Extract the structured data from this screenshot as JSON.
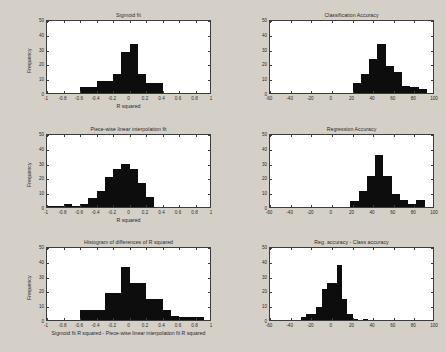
{
  "figure": {
    "background_color": "#d4d0c8",
    "plot_background_color": "#ffffff",
    "bar_color": "#0d0d0d",
    "axis_color": "#3c3c3c"
  },
  "chart_data": [
    {
      "type": "bar",
      "id": "sigmoid-fit",
      "title": "Sigmoid fit",
      "xlabel": "R squared",
      "ylabel": "Frequency",
      "xlim": [
        -1,
        1
      ],
      "ylim": [
        0,
        50
      ],
      "xticks": [
        -1,
        -0.8,
        -0.6,
        -0.4,
        -0.2,
        0,
        0.2,
        0.4,
        0.6,
        0.8,
        1
      ],
      "xticklabels": [
        "-1",
        "-0.8",
        "-0.6",
        "-0.4",
        "-0.2",
        "0",
        "0.2",
        "0.4",
        "0.6",
        "0.8",
        "1"
      ],
      "yticks": [
        0,
        10,
        20,
        30,
        40,
        50
      ],
      "yticklabels": [
        "0",
        "10",
        "20",
        "30",
        "40",
        "50"
      ],
      "grid": false,
      "bin_edges": [
        -0.6,
        -0.5,
        -0.4,
        -0.3,
        -0.2,
        -0.1,
        0.0,
        0.1,
        0.2,
        0.3,
        0.4
      ],
      "values": [
        4,
        4,
        8,
        8,
        13,
        28,
        33,
        13,
        7,
        7
      ]
    },
    {
      "type": "bar",
      "id": "classification-accuracy",
      "title": "Classification Accuracy",
      "xlabel": "",
      "ylabel": "",
      "xlim": [
        -60,
        100
      ],
      "ylim": [
        0,
        50
      ],
      "xticks": [
        -60,
        -40,
        -20,
        0,
        20,
        40,
        60,
        80,
        100
      ],
      "xticklabels": [
        "-60",
        "-40",
        "-20",
        "0",
        "20",
        "40",
        "60",
        "80",
        "100"
      ],
      "yticks": [
        0,
        10,
        20,
        30,
        40,
        50
      ],
      "yticklabels": [
        "0",
        "10",
        "20",
        "30",
        "40",
        "50"
      ],
      "grid": false,
      "bin_edges": [
        20,
        28,
        36,
        44,
        52,
        60,
        68,
        76,
        84,
        92
      ],
      "values": [
        7,
        13,
        23,
        33,
        18,
        14,
        5,
        4,
        3
      ]
    },
    {
      "type": "bar",
      "id": "piecewise-linear-fit",
      "title": "Piece-wise linear interpolation fit",
      "xlabel": "R squared",
      "ylabel": "Frequency",
      "xlim": [
        -1,
        1
      ],
      "ylim": [
        0,
        50
      ],
      "xticks": [
        -1,
        -0.8,
        -0.6,
        -0.4,
        -0.2,
        0,
        0.2,
        0.4,
        0.6,
        0.8,
        1
      ],
      "xticklabels": [
        "-1",
        "-0.8",
        "-0.6",
        "-0.4",
        "-0.2",
        "0",
        "0.2",
        "0.4",
        "0.6",
        "0.8",
        "1"
      ],
      "yticks": [
        0,
        10,
        20,
        30,
        40,
        50
      ],
      "yticklabels": [
        "0",
        "10",
        "20",
        "30",
        "40",
        "50"
      ],
      "grid": false,
      "bin_edges": [
        -1.0,
        -0.9,
        -0.8,
        -0.7,
        -0.6,
        -0.5,
        -0.4,
        -0.3,
        -0.2,
        -0.1,
        0.0,
        0.1,
        0.2,
        0.3
      ],
      "values": [
        1,
        1,
        2,
        1,
        2,
        6,
        11,
        20,
        26,
        29,
        26,
        16,
        7
      ]
    },
    {
      "type": "bar",
      "id": "regression-accuracy",
      "title": "Regression Accuracy",
      "xlabel": "",
      "ylabel": "",
      "xlim": [
        -60,
        100
      ],
      "ylim": [
        0,
        50
      ],
      "xticks": [
        -60,
        -40,
        -20,
        0,
        20,
        40,
        60,
        80,
        100
      ],
      "xticklabels": [
        "-60",
        "-40",
        "-20",
        "0",
        "20",
        "40",
        "60",
        "80",
        "100"
      ],
      "yticks": [
        0,
        10,
        20,
        30,
        40,
        50
      ],
      "yticklabels": [
        "0",
        "10",
        "20",
        "30",
        "40",
        "50"
      ],
      "grid": false,
      "bin_edges": [
        18,
        26,
        34,
        42,
        50,
        58,
        66,
        74,
        82,
        90
      ],
      "values": [
        4,
        11,
        21,
        35,
        21,
        9,
        5,
        2,
        5
      ]
    },
    {
      "type": "bar",
      "id": "differences-of-r-squared",
      "title": "Histogram of differences of R squared",
      "xlabel": "Sigmoid fit R squared - Piece-wise linear interpolation fit R squared",
      "ylabel": "Frequency",
      "xlim": [
        -1,
        1
      ],
      "ylim": [
        0,
        50
      ],
      "xticks": [
        -1,
        -0.8,
        -0.6,
        -0.4,
        -0.2,
        0,
        0.2,
        0.4,
        0.6,
        0.8,
        1
      ],
      "xticklabels": [
        "-1",
        "-0.8",
        "-0.6",
        "-0.4",
        "-0.2",
        "0",
        "0.2",
        "0.4",
        "0.6",
        "0.8",
        "1"
      ],
      "yticks": [
        0,
        10,
        20,
        30,
        40,
        50
      ],
      "yticklabels": [
        "0",
        "10",
        "20",
        "30",
        "40",
        "50"
      ],
      "grid": false,
      "bin_edges": [
        -0.6,
        -0.5,
        -0.4,
        -0.3,
        -0.2,
        -0.1,
        0.0,
        0.1,
        0.2,
        0.3,
        0.4,
        0.5,
        0.6,
        0.7,
        0.8,
        0.9
      ],
      "values": [
        7,
        7,
        7,
        18,
        18,
        36,
        25,
        25,
        14,
        14,
        7,
        3,
        2,
        2,
        2
      ]
    },
    {
      "type": "bar",
      "id": "reg-minus-class-accuracy",
      "title": "Reg. accuracy - Class accuracy",
      "xlabel": "",
      "ylabel": "",
      "xlim": [
        -60,
        100
      ],
      "ylim": [
        0,
        50
      ],
      "xticks": [
        -60,
        -40,
        -20,
        0,
        20,
        40,
        60,
        80,
        100
      ],
      "xticklabels": [
        "-60",
        "-40",
        "-20",
        "0",
        "20",
        "40",
        "60",
        "80",
        "100"
      ],
      "yticks": [
        0,
        10,
        20,
        30,
        40,
        50
      ],
      "yticklabels": [
        "0",
        "10",
        "20",
        "30",
        "40",
        "50"
      ],
      "grid": false,
      "bin_edges": [
        -30,
        -25,
        -20,
        -15,
        -10,
        -5,
        0,
        5,
        10,
        15,
        20,
        25,
        30,
        35
      ],
      "values": [
        2,
        4,
        4,
        9,
        21,
        25,
        25,
        37,
        14,
        4,
        1,
        0,
        1
      ]
    }
  ]
}
